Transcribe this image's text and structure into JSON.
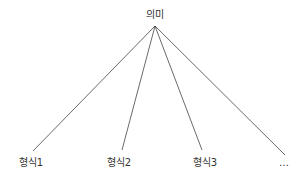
{
  "diagram": {
    "root": {
      "label": "의미",
      "x": 155,
      "y": 10
    },
    "apex": {
      "x": 155,
      "y": 26
    },
    "children": [
      {
        "label": "형식1",
        "x": 31,
        "y": 157,
        "line_end": [
          33,
          151
        ]
      },
      {
        "label": "형식2",
        "x": 119,
        "y": 157,
        "line_end": [
          122,
          150
        ]
      },
      {
        "label": "형식3",
        "x": 205,
        "y": 157,
        "line_end": [
          202,
          150
        ]
      },
      {
        "label": "…",
        "x": 284,
        "y": 157,
        "line_end": [
          285,
          155
        ]
      }
    ],
    "line_color": "#444444"
  }
}
